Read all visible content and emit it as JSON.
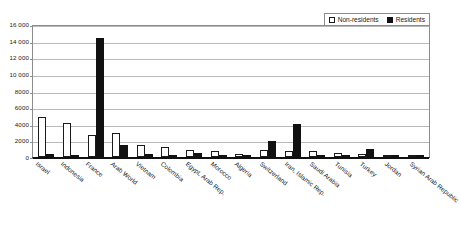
{
  "chart_data": {
    "type": "bar",
    "title": "",
    "subtitle": "",
    "xlabel": "",
    "ylabel": "",
    "ylim": [
      0,
      16000
    ],
    "ytick_step": 2000,
    "ytick_labels": [
      "16 000",
      "14 000",
      "12 000",
      "10 000",
      "8000",
      "6000",
      "4000",
      "2000",
      "0"
    ],
    "ytick_values": [
      16000,
      14000,
      12000,
      10000,
      8000,
      6000,
      4000,
      2000,
      0
    ],
    "grid": true,
    "legend_position": "top-right",
    "categories": [
      "Israel",
      "Indonesia",
      "France",
      "Arab World",
      "Vietnam",
      "Colombia",
      "Egypt, Arab Rep.",
      "Morocco",
      "Algeria",
      "Switzerland",
      "Iran, Islamic Rep.",
      "Saudi Arabia",
      "Tunisia",
      "Turkey",
      "Jordan",
      "Syrian Arab Republic"
    ],
    "series": [
      {
        "name": "Non-residents",
        "color": "#ffffff",
        "values": [
          4800,
          4150,
          2700,
          2900,
          1400,
          1150,
          900,
          750,
          330,
          850,
          700,
          700,
          430,
          400,
          210,
          120
        ]
      },
      {
        "name": "Residents",
        "color": "#111111",
        "values": [
          330,
          290,
          14350,
          1500,
          340,
          230,
          430,
          180,
          130,
          1950,
          4000,
          230,
          140,
          1000,
          60,
          40
        ]
      }
    ]
  },
  "legend": {
    "entries": [
      {
        "label": "Non-residents",
        "swatch": "hollow-square"
      },
      {
        "label": "Residents",
        "swatch": "filled-square"
      }
    ]
  },
  "colors": {
    "non_residents": "#ffffff",
    "residents": "#111111",
    "gridline": "#b9b9b9",
    "axis": "#111111",
    "plot_border": "#8c8c8c",
    "background": "#ffffff",
    "text": "#1a1a1a"
  }
}
